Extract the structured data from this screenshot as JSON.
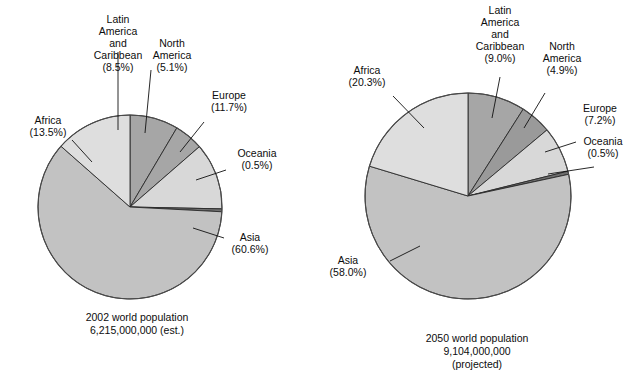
{
  "chart_data": [
    {
      "type": "pie",
      "title": "2002 world population",
      "subtitle": "6,215,000,000 (est.)",
      "caption_lines": [
        "2002 world population",
        "6,215,000,000 (est.)"
      ],
      "total_population": "6,215,000,000",
      "year": "2002",
      "basis": "est.",
      "categories": [
        "Latin America and Caribbean",
        "North America",
        "Europe",
        "Oceania",
        "Asia",
        "Africa"
      ],
      "values": [
        8.5,
        5.1,
        11.7,
        0.5,
        60.6,
        13.5
      ],
      "unit": "percent",
      "legend": "none",
      "slices": [
        {
          "name": "Latin America and Caribbean",
          "label_lines": [
            "Latin",
            "America",
            "and",
            "Caribbean",
            "(8.5%)"
          ],
          "percent_text": "(8.5%)",
          "value": 8.5,
          "color": "#a6a6a6"
        },
        {
          "name": "North America",
          "label_lines": [
            "North",
            "America",
            "(5.1%)"
          ],
          "percent_text": "(5.1%)",
          "value": 5.1,
          "color": "#a6a6a6"
        },
        {
          "name": "Europe",
          "label_lines": [
            "Europe",
            "(11.7%)"
          ],
          "percent_text": "(11.7%)",
          "value": 11.7,
          "color": "#d8d8d8"
        },
        {
          "name": "Oceania",
          "label_lines": [
            "Oceania",
            "(0.5%)"
          ],
          "percent_text": "(0.5%)",
          "value": 0.5,
          "color": "#6f6f6f"
        },
        {
          "name": "Asia",
          "label_lines": [
            "Asia",
            "(60.6%)"
          ],
          "percent_text": "(60.6%)",
          "value": 60.6,
          "color": "#c2c2c2"
        },
        {
          "name": "Africa",
          "label_lines": [
            "Africa",
            "(13.5%)"
          ],
          "percent_text": "(13.5%)",
          "value": 13.5,
          "color": "#dedede"
        }
      ]
    },
    {
      "type": "pie",
      "title": "2050 world population",
      "subtitle": "9,104,000,000 (projected)",
      "caption_lines": [
        "2050 world population",
        "9,104,000,000",
        "(projected)"
      ],
      "total_population": "9,104,000,000",
      "year": "2050",
      "basis": "projected",
      "categories": [
        "Latin America and Caribbean",
        "North America",
        "Europe",
        "Oceania",
        "Asia",
        "Africa"
      ],
      "values": [
        9.0,
        4.9,
        7.2,
        0.5,
        58.0,
        20.3
      ],
      "unit": "percent",
      "legend": "none",
      "slices": [
        {
          "name": "Latin America and Caribbean",
          "label_lines": [
            "Latin",
            "America",
            "and",
            "Caribbean",
            "(9.0%)"
          ],
          "percent_text": "(9.0%)",
          "value": 9.0,
          "color": "#a6a6a6"
        },
        {
          "name": "North America",
          "label_lines": [
            "North",
            "America",
            "(4.9%)"
          ],
          "percent_text": "(4.9%)",
          "value": 4.9,
          "color": "#9a9a9a"
        },
        {
          "name": "Europe",
          "label_lines": [
            "Europe",
            "(7.2%)"
          ],
          "percent_text": "(7.2%)",
          "value": 7.2,
          "color": "#d8d8d8"
        },
        {
          "name": "Oceania",
          "label_lines": [
            "Oceania",
            "(0.5%)"
          ],
          "percent_text": "(0.5%)",
          "value": 0.5,
          "color": "#6f6f6f"
        },
        {
          "name": "Asia",
          "label_lines": [
            "Asia",
            "(58.0%)"
          ],
          "percent_text": "(58.0%)",
          "value": 58.0,
          "color": "#c2c2c2"
        },
        {
          "name": "Africa",
          "label_lines": [
            "Africa",
            "(20.3%)"
          ],
          "percent_text": "(20.3%)",
          "value": 20.3,
          "color": "#dedede"
        }
      ]
    }
  ],
  "left_chart": {
    "caption_line1": "2002 world population",
    "caption_line2": "6,215,000,000 (est.)",
    "labels": {
      "latin_l1": "Latin",
      "latin_l2": "America",
      "latin_l3": "and",
      "latin_l4": "Caribbean",
      "latin_pct": "(8.5%)",
      "north_l1": "North",
      "north_l2": "America",
      "north_pct": "(5.1%)",
      "europe_l1": "Europe",
      "europe_pct": "(11.7%)",
      "oceania_l1": "Oceania",
      "oceania_pct": "(0.5%)",
      "asia_l1": "Asia",
      "asia_pct": "(60.6%)",
      "africa_l1": "Africa",
      "africa_pct": "(13.5%)"
    }
  },
  "right_chart": {
    "caption_line1": "2050 world population",
    "caption_line2": "9,104,000,000",
    "caption_line3": "(projected)",
    "labels": {
      "latin_l1": "Latin",
      "latin_l2": "America",
      "latin_l3": "and",
      "latin_l4": "Caribbean",
      "latin_pct": "(9.0%)",
      "north_l1": "North",
      "north_l2": "America",
      "north_pct": "(4.9%)",
      "europe_l1": "Europe",
      "europe_pct": "(7.2%)",
      "oceania_l1": "Oceania",
      "oceania_pct": "(0.5%)",
      "asia_l1": "Asia",
      "asia_pct": "(58.0%)",
      "africa_l1": "Africa",
      "africa_pct": "(20.3%)"
    }
  },
  "colors": {
    "africa": "#dedede",
    "asia": "#c2c2c2",
    "europe": "#d8d8d8",
    "latin_america": "#a6a6a6",
    "north_america": "#9a9a9a",
    "oceania": "#6f6f6f",
    "outline": "#2a2a2a",
    "background": "#ffffff"
  }
}
